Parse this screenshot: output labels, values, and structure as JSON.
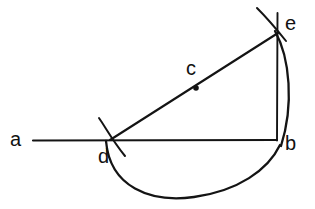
{
  "figure": {
    "stroke_color": "#141414",
    "background_color": "#ffffff",
    "width": 315,
    "height": 209
  },
  "labels": [
    {
      "id": "a",
      "text": "a",
      "x": 10,
      "y": 129
    },
    {
      "id": "d",
      "text": "d",
      "x": 98,
      "y": 146
    },
    {
      "id": "c",
      "text": "c",
      "x": 186,
      "y": 58
    },
    {
      "id": "e",
      "text": "e",
      "x": 285,
      "y": 13
    },
    {
      "id": "b",
      "text": "b",
      "x": 285,
      "y": 133
    }
  ],
  "points": [
    {
      "id": "a",
      "x": 33,
      "y": 140
    },
    {
      "id": "b",
      "x": 277,
      "y": 140
    },
    {
      "id": "c",
      "x": 196,
      "y": 88
    },
    {
      "id": "d",
      "x": 110,
      "y": 140
    },
    {
      "id": "e",
      "x": 278,
      "y": 33
    }
  ],
  "segments": [
    {
      "id": "line-a-b",
      "from": "a",
      "to": "b",
      "kind": "straight"
    },
    {
      "id": "line-d-e",
      "from": "d",
      "to": "e",
      "kind": "straight"
    },
    {
      "id": "line-e-b",
      "from": "e",
      "to": "b",
      "kind": "vertical"
    }
  ],
  "arcs": [
    {
      "id": "arc-e-b",
      "from": "e",
      "to": "b",
      "bulge": "right"
    },
    {
      "id": "arc-d-b",
      "from": "d",
      "to": "b",
      "bulge": "down"
    }
  ],
  "construction_marks": [
    {
      "id": "tick-arc-at-d",
      "at": "d"
    },
    {
      "id": "tick-arc-at-e",
      "at": "e"
    },
    {
      "id": "vertical-extension-above-e",
      "at": "e"
    }
  ],
  "markers": [
    {
      "id": "dot-c",
      "at": "c",
      "shape": "dot",
      "radius": 2.6
    }
  ]
}
